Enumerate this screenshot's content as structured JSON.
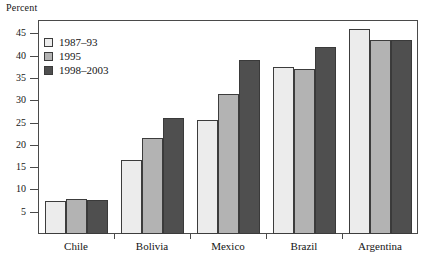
{
  "chart_data": {
    "type": "bar",
    "title": "",
    "xlabel": "",
    "ylabel": "Percent",
    "ylim": [
      0,
      48
    ],
    "yticks": [
      5,
      10,
      15,
      20,
      25,
      30,
      35,
      40,
      45
    ],
    "grid": false,
    "legend_position": "top-left",
    "categories": [
      "Chile",
      "Bolivia",
      "Mexico",
      "Brazil",
      "Argentina"
    ],
    "series": [
      {
        "name": "1987–93",
        "values": [
          7.3,
          16.5,
          25.5,
          37.5,
          46.0
        ],
        "color": "#ececec"
      },
      {
        "name": "1995",
        "values": [
          7.9,
          21.5,
          31.5,
          37.0,
          43.5
        ],
        "color": "#b3b3b3"
      },
      {
        "name": "1998–2003",
        "values": [
          7.7,
          26.0,
          39.0,
          42.0,
          43.5
        ],
        "color": "#4f4f4f"
      }
    ]
  },
  "axis": {
    "y_title": "Percent",
    "tick_labels": [
      "45",
      "40",
      "35",
      "30",
      "25",
      "20",
      "15",
      "10",
      "5"
    ]
  },
  "legend": {
    "items": [
      {
        "label": "1987–93"
      },
      {
        "label": "1995"
      },
      {
        "label": "1998–2003"
      }
    ]
  }
}
